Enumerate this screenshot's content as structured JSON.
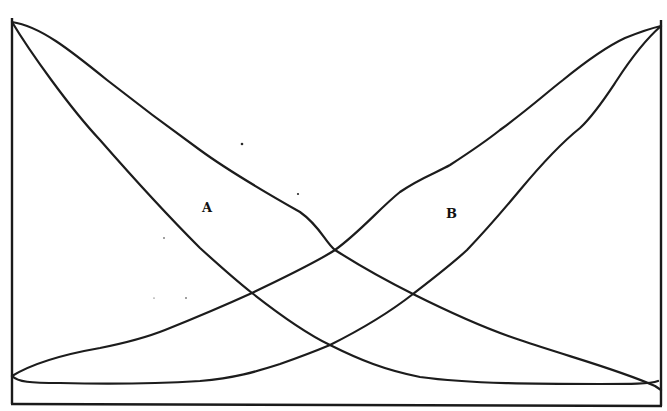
{
  "diagram": {
    "type": "crossing-curves",
    "labels": {
      "a": "A",
      "b": "B"
    },
    "regions": [
      {
        "label": "A",
        "description": "lens region bounded by two curves descending from top-left to bottom-right"
      },
      {
        "label": "B",
        "description": "lens region bounded by two curves rising from bottom-left to top-right"
      }
    ],
    "frame": {
      "left_x": 12,
      "right_x": 661,
      "bottom_y": 404
    },
    "curves": {
      "a_outer": [
        [
          12,
          22
        ],
        [
          40,
          30
        ],
        [
          107,
          80
        ],
        [
          150,
          115
        ],
        [
          200,
          150
        ],
        [
          250,
          185
        ],
        [
          300,
          210
        ],
        [
          335,
          250
        ],
        [
          413,
          294
        ],
        [
          500,
          335
        ],
        [
          600,
          367
        ],
        [
          661,
          390
        ]
      ],
      "a_inner": [
        [
          12,
          22
        ],
        [
          50,
          80
        ],
        [
          100,
          140
        ],
        [
          150,
          195
        ],
        [
          200,
          248
        ],
        [
          252,
          293
        ],
        [
          330,
          345
        ],
        [
          400,
          372
        ],
        [
          500,
          383
        ],
        [
          600,
          384
        ],
        [
          652,
          380
        ],
        [
          661,
          376
        ]
      ],
      "b_outer": [
        [
          12,
          376
        ],
        [
          50,
          360
        ],
        [
          100,
          348
        ],
        [
          165,
          330
        ],
        [
          252,
          293
        ],
        [
          335,
          250
        ],
        [
          400,
          192
        ],
        [
          450,
          165
        ],
        [
          500,
          130
        ],
        [
          563,
          80
        ],
        [
          620,
          38
        ],
        [
          661,
          26
        ]
      ],
      "b_inner": [
        [
          12,
          376
        ],
        [
          30,
          381
        ],
        [
          120,
          383
        ],
        [
          200,
          381
        ],
        [
          260,
          370
        ],
        [
          330,
          345
        ],
        [
          413,
          294
        ],
        [
          467,
          250
        ],
        [
          520,
          190
        ],
        [
          580,
          128
        ],
        [
          617,
          80
        ],
        [
          661,
          26
        ]
      ]
    },
    "intersections": [
      [
        252,
        293
      ],
      [
        335,
        250
      ],
      [
        413,
        294
      ],
      [
        330,
        345
      ]
    ],
    "stroke_color": "#1c1c1c",
    "background_color": "#ffffff"
  }
}
